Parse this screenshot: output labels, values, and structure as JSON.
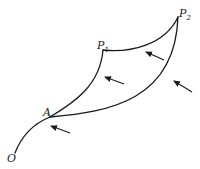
{
  "diagram": {
    "points": {
      "O": {
        "label": "O"
      },
      "A": {
        "label": "A"
      },
      "P1": {
        "label": "P",
        "subscript": "1"
      },
      "P2": {
        "label": "P",
        "subscript": "2"
      }
    },
    "paths": [
      {
        "name": "O-to-A",
        "from": "O",
        "to": "A"
      },
      {
        "name": "A-to-P1",
        "from": "A",
        "to": "P1"
      },
      {
        "name": "P1-to-P2",
        "from": "P1",
        "to": "P2"
      },
      {
        "name": "A-to-P2",
        "from": "A",
        "to": "P2"
      }
    ],
    "arrows": [
      {
        "name": "arrow-near-A",
        "direction": "up-left"
      },
      {
        "name": "arrow-near-A-P1-path",
        "direction": "up-left"
      },
      {
        "name": "arrow-near-P1-P2-path",
        "direction": "up-left"
      },
      {
        "name": "arrow-near-A-P2-path",
        "direction": "up-left"
      }
    ],
    "colors": {
      "stroke": "#1a1a1a",
      "background": "#ffffff"
    }
  }
}
